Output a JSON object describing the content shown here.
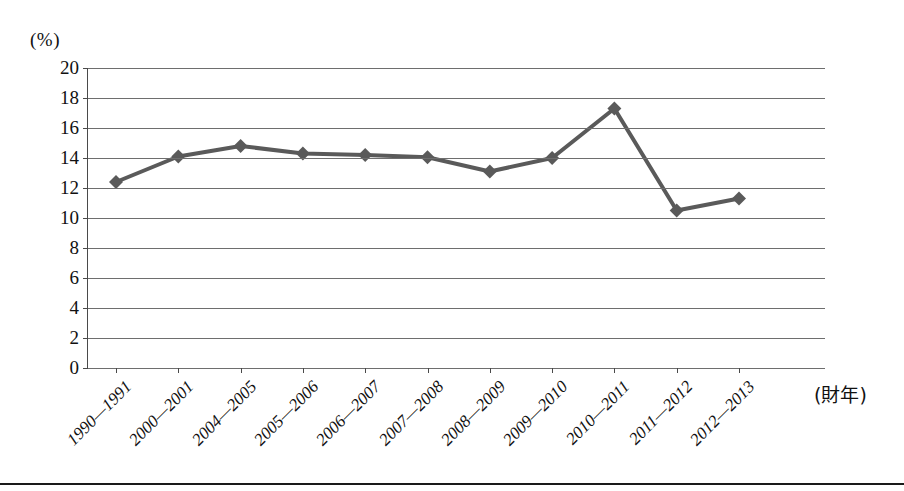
{
  "figure": {
    "y_axis_unit_label": "(%)",
    "x_axis_title": "(財年)"
  },
  "chart_data": {
    "type": "line",
    "title": "",
    "subtitle": "",
    "xlabel": "(財年)",
    "ylabel": "(%)",
    "categories": [
      "1990—1991",
      "2000—2001",
      "2004—2005",
      "2005—2006",
      "2006—2007",
      "2007—2008",
      "2008—2009",
      "2009—2010",
      "2010—2011",
      "2011—2012",
      "2012—2013"
    ],
    "values": [
      12.4,
      14.1,
      14.8,
      14.3,
      14.2,
      14.05,
      13.1,
      14.0,
      17.3,
      10.5,
      11.3
    ],
    "series": [
      {
        "name": "",
        "values": [
          12.4,
          14.1,
          14.8,
          14.3,
          14.2,
          14.05,
          13.1,
          14.0,
          17.3,
          10.5,
          11.3
        ]
      }
    ],
    "ylim": [
      0,
      20
    ],
    "ytick_step": 2,
    "yticks": [
      20,
      18,
      16,
      14,
      12,
      10,
      8,
      6,
      4,
      2,
      0
    ],
    "ytick_labels": [
      "20",
      "18",
      "16",
      "14",
      "12",
      "10",
      "8",
      "6",
      "4",
      "2",
      "0"
    ],
    "grid": true,
    "grid_axis": "y",
    "legend": false,
    "legend_position": "none",
    "marker": "diamond",
    "line_color": "#5a5a5a",
    "marker_color": "#5a5a5a",
    "grid_color": "#6e6e6e",
    "axis_color": "#4a4a4a",
    "text_color": "#111111",
    "background_color": "#ffffff"
  }
}
